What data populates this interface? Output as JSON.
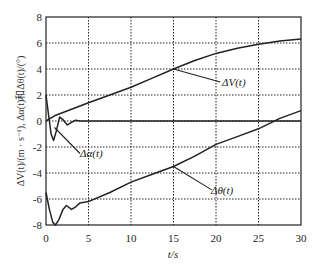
{
  "chart_data": {
    "type": "line",
    "title": "",
    "xlabel": "t/s",
    "ylabel": "ΔV(t)/(m · s⁻¹), Δα(t)和Δθ(t)/(°)",
    "xlim": [
      0,
      30
    ],
    "ylim": [
      -8,
      8
    ],
    "xticks": [
      0,
      5,
      10,
      15,
      20,
      25,
      30
    ],
    "yticks": [
      -8,
      -6,
      -4,
      -2,
      0,
      2,
      4,
      6,
      8
    ],
    "grid": true,
    "legend": "inline annotations with leader lines",
    "series": [
      {
        "name": "ΔV(t)",
        "label": "ΔV(t)",
        "x": [
          0,
          1,
          2,
          3,
          5,
          7.5,
          10,
          12.5,
          15,
          17.5,
          20,
          22.5,
          25,
          27.5,
          30
        ],
        "y": [
          0,
          0.4,
          0.65,
          0.9,
          1.4,
          2.0,
          2.6,
          3.3,
          4.0,
          4.65,
          5.2,
          5.6,
          5.9,
          6.15,
          6.3
        ]
      },
      {
        "name": "Δα(t)",
        "label": "Δα(t)",
        "x": [
          0,
          0.3,
          0.6,
          0.9,
          1.2,
          1.6,
          2.0,
          2.5,
          3.0,
          3.5,
          4.0,
          5,
          10,
          15,
          20,
          25,
          30
        ],
        "y": [
          2.0,
          0.5,
          -1.0,
          -1.5,
          -0.8,
          0.3,
          0.1,
          -0.3,
          -0.1,
          0.05,
          0.0,
          0.0,
          0.0,
          0.0,
          0.0,
          0.0,
          0.0
        ]
      },
      {
        "name": "Δθ(t)",
        "label": "Δθ(t)",
        "x": [
          0,
          0.4,
          0.8,
          1.1,
          1.5,
          2.0,
          2.4,
          3.0,
          3.5,
          4.0,
          5,
          7.5,
          10,
          12.5,
          15,
          17.5,
          20,
          22.5,
          25,
          27.5,
          30
        ],
        "y": [
          -5.5,
          -6.8,
          -7.8,
          -8.0,
          -7.6,
          -6.8,
          -6.5,
          -6.8,
          -6.6,
          -6.3,
          -6.2,
          -5.5,
          -4.7,
          -4.1,
          -3.5,
          -2.7,
          -1.8,
          -1.2,
          -0.6,
          0.2,
          0.8
        ]
      }
    ],
    "annotations": [
      {
        "text": "ΔV(t)",
        "point": [
          15,
          4.0
        ],
        "label_at": [
          20.5,
          3.0
        ]
      },
      {
        "text": "Δα(t)",
        "point": [
          1.0,
          -0.5
        ],
        "label_at": [
          4.0,
          -2.5
        ]
      },
      {
        "text": "Δθ(t)",
        "point": [
          15,
          -3.5
        ],
        "label_at": [
          19.5,
          -5.3
        ]
      }
    ]
  },
  "axes": {
    "xlabel": "t/s",
    "ylabel": "ΔV(t)/(m · s⁻¹), Δα(t)和Δθ(t)/(°)",
    "xticks": [
      "0",
      "5",
      "10",
      "15",
      "20",
      "25",
      "30"
    ],
    "yticks": [
      "8",
      "6",
      "4",
      "2",
      "0",
      "-2",
      "-4",
      "-6",
      "-8"
    ]
  },
  "labels": {
    "dV": "ΔV(t)",
    "dAlpha": "Δα(t)",
    "dTheta": "Δθ(t)"
  }
}
